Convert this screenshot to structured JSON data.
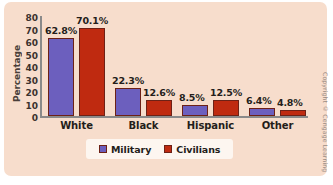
{
  "chart_data": {
    "type": "bar",
    "title": "",
    "subtitle": "",
    "xlabel": "",
    "ylabel": "Percentage",
    "ylim": [
      0,
      80
    ],
    "yticks": [
      0,
      10,
      20,
      30,
      40,
      50,
      60,
      70,
      80
    ],
    "ytick_labels": [
      "0",
      "10",
      "20",
      "30",
      "40",
      "50",
      "60",
      "70",
      "80"
    ],
    "grid": false,
    "legend_position": "bottom",
    "categories": [
      "White",
      "Black",
      "Hispanic",
      "Other"
    ],
    "series": [
      {
        "name": "Military",
        "color": "#6c5fbe",
        "values": [
          62.8,
          22.3,
          8.5,
          6.4
        ],
        "data_labels": [
          "62.8%",
          "22.3%",
          "8.5%",
          "6.4%"
        ]
      },
      {
        "name": "Civilians",
        "color": "#bf2a10",
        "values": [
          70.1,
          12.6,
          12.5,
          4.8
        ],
        "data_labels": [
          "70.1%",
          "12.6%",
          "12.5%",
          "4.8%"
        ]
      }
    ]
  },
  "legend": {
    "items": [
      {
        "label": "Military"
      },
      {
        "label": "Civilians"
      }
    ]
  },
  "footer": {
    "copyright": "Copyright © Cengage Learning"
  },
  "colors": {
    "panel_background": "#f7ddcc",
    "military": "#6c5fbe",
    "civilians": "#bf2a10",
    "bar_border": "#6d2116",
    "axis": "#8a8a8a",
    "text": "#241d1a",
    "legend_background": "#fdf6f0"
  }
}
